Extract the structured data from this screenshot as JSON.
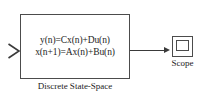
{
  "diagram": {
    "type": "block-diagram",
    "background_color": "#ffffff",
    "line_color": "#4c4c4c",
    "text_color": "#1c1c1c",
    "blocks": [
      {
        "id": "discrete-state-space",
        "label": "Discrete State-Space",
        "equations": [
          "y(n)=Cx(n)+Du(n)",
          "x(n+1)=Ax(n)+Bu(n)"
        ],
        "has_input_port": true
      },
      {
        "id": "scope",
        "label": "Scope",
        "icon": "scope-screen-icon"
      }
    ],
    "connections": [
      {
        "from": "discrete-state-space",
        "to": "scope",
        "style": "arrow"
      }
    ]
  }
}
